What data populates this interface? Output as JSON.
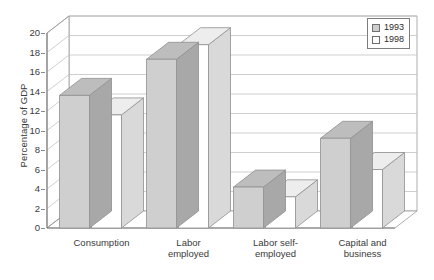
{
  "chart_data": {
    "type": "bar",
    "title": "",
    "subtitle": "",
    "xlabel": "",
    "ylabel": "Percentage of GDP",
    "ylim": [
      0,
      20
    ],
    "ytick_step": 2,
    "yticks": [
      0,
      2,
      4,
      6,
      8,
      10,
      12,
      14,
      16,
      18,
      20
    ],
    "ytick_labels": [
      "0",
      "2",
      "4",
      "6",
      "8",
      "10",
      "12",
      "14",
      "16",
      "18",
      "20"
    ],
    "grid": true,
    "grid_axis": "y",
    "projection": "3d",
    "legend_position": "top-right",
    "categories": [
      "Consumption",
      "Labor\nemployed",
      "Labor self-\nemployed",
      "Capital and\nbusiness"
    ],
    "category_labels": [
      "Consumption",
      "Labor employed",
      "Labor self-employed",
      "Capital and business"
    ],
    "series": [
      {
        "name": "1993",
        "color": "#cfcfcf",
        "values": [
          13.6,
          17.3,
          4.2,
          9.2
        ]
      },
      {
        "name": "1998",
        "color": "#ffffff",
        "values": [
          11.6,
          18.8,
          3.2,
          6.0
        ]
      }
    ]
  },
  "legend": {
    "entries": [
      {
        "label": "1993",
        "swatch": "gray"
      },
      {
        "label": "1998",
        "swatch": "white"
      }
    ]
  },
  "colors": {
    "bar_1993_front": "#cfcfcf",
    "bar_1993_top": "#bdbdbd",
    "bar_1993_side": "#a8a8a8",
    "bar_1998_front": "#ffffff",
    "bar_1998_top": "#ededed",
    "bar_1998_side": "#d9d9d9",
    "axis": "#7d7d7d",
    "grid": "#c3c3c3",
    "text": "#3a3a3a",
    "background": "#ffffff"
  }
}
